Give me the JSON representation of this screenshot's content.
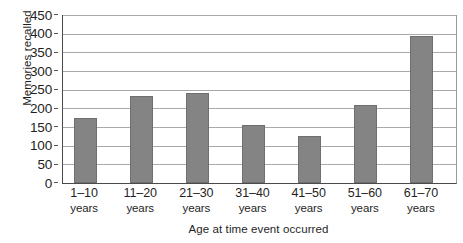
{
  "chart_data": {
    "type": "bar",
    "title": "",
    "xlabel": "Age at time event occurred",
    "ylabel": "Memories recalled",
    "categories": [
      "1–10 years",
      "11–20 years",
      "21–30 years",
      "31–40 years",
      "41–50 years",
      "51–60 years",
      "61–70 years"
    ],
    "category_ranges": [
      "1–10",
      "11–20",
      "21–30",
      "31–40",
      "41–50",
      "51–60",
      "61–70"
    ],
    "category_unit": "years",
    "values": [
      175,
      232,
      242,
      155,
      127,
      208,
      393
    ],
    "ylim": [
      0,
      450
    ],
    "ytick_labels": [
      "450",
      "400",
      "350",
      "300",
      "250",
      "200",
      "150",
      "100",
      "50",
      "0"
    ],
    "ytick_values": [
      450,
      400,
      350,
      300,
      250,
      200,
      150,
      100,
      50,
      0
    ],
    "ytick_step": 50,
    "grid": true,
    "grid_axis": "y",
    "legend": false,
    "bar_color": "#848484",
    "bar_edge_color": "#6f6f6f",
    "axis_color": "#4a4a4a",
    "grid_color": "#a9a9a9",
    "background_color": "#ffffff"
  }
}
